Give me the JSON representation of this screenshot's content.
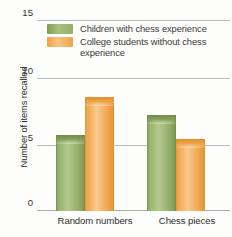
{
  "chart_data": {
    "type": "bar",
    "title": "",
    "xlabel": "",
    "ylabel": "Number of items recalled",
    "categories": [
      "Random numbers",
      "Chess pieces"
    ],
    "series": [
      {
        "name": "Children with chess experience",
        "color": "#94ae67",
        "values": [
          6.0,
          7.6
        ]
      },
      {
        "name": "College students without chess experience",
        "color": "#f0a446",
        "values": [
          9.0,
          5.7
        ]
      }
    ],
    "ylim": [
      0,
      15
    ],
    "yticks": [
      0,
      5,
      10,
      15
    ],
    "ytick_labels": [
      "0",
      "5",
      "10",
      "15"
    ],
    "grid": true,
    "legend_position": "top-left-inside"
  },
  "axis": {
    "y_title": "Number of items recalled",
    "ticks": [
      {
        "label": "15",
        "value": 15
      },
      {
        "label": "10",
        "value": 10
      },
      {
        "label": "5",
        "value": 5
      },
      {
        "label": "0",
        "value": 0
      }
    ]
  },
  "legend": {
    "items": [
      {
        "label": "Children with chess experience",
        "swatch": "green"
      },
      {
        "label": "College students without chess experience",
        "swatch": "orange"
      }
    ]
  },
  "categories": [
    {
      "label": "Random numbers"
    },
    {
      "label": "Chess pieces"
    }
  ]
}
